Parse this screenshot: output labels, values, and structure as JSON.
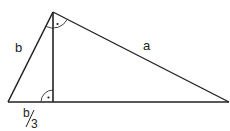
{
  "diagram": {
    "type": "right-triangle-with-altitude",
    "colors": {
      "stroke": "#222222",
      "background": "#ffffff"
    },
    "vertices": {
      "left": [
        8,
        102
      ],
      "top": [
        53,
        12
      ],
      "right": [
        229,
        102
      ],
      "altitude_foot": [
        53,
        102
      ]
    },
    "labels": {
      "side_b": "b",
      "side_a": "a",
      "segment_numerator": "b",
      "segment_denominator": "3"
    },
    "right_angle_marks": [
      "top vertex (angle between b and a)",
      "altitude foot"
    ],
    "right_angle_dot": "·"
  }
}
